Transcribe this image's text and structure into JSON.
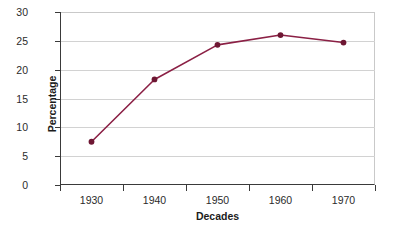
{
  "chart_data": {
    "type": "line",
    "title": "",
    "subtitle": "",
    "xlabel": "Decades",
    "ylabel": "Percentage",
    "categories": [
      "1930",
      "1940",
      "1950",
      "1960",
      "1970"
    ],
    "x": [
      1930,
      1940,
      1950,
      1960,
      1970
    ],
    "values": [
      7.5,
      18.3,
      24.3,
      26.0,
      24.7
    ],
    "series": [
      {
        "name": "Percentage",
        "values": [
          7.5,
          18.3,
          24.3,
          26.0,
          24.7
        ]
      }
    ],
    "ylim": [
      0,
      30
    ],
    "yticks": [
      0,
      5,
      10,
      15,
      20,
      25,
      30
    ],
    "ytick_labels": [
      "0",
      "5",
      "10",
      "15",
      "20",
      "25",
      "30"
    ],
    "xtick_labels": [
      "1930",
      "1940",
      "1950",
      "1960",
      "1970"
    ],
    "grid": true,
    "grid_axis": "y",
    "legend": false,
    "legend_position": "none",
    "line_color": "#8B2045",
    "marker_color": "#6E1733",
    "marker_shape": "circle",
    "plot_background": "#ffffff",
    "figure_background": "#ffffff",
    "axis_color": "#3a3a3a",
    "gridline_color": "#d2d2d2"
  }
}
